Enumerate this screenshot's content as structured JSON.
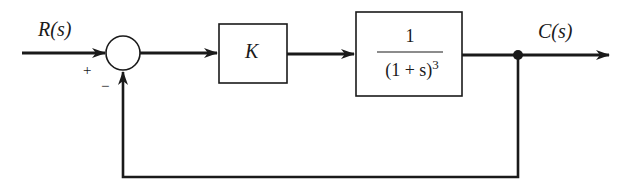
{
  "diagram": {
    "type": "block-diagram",
    "input_label": "R(s)",
    "output_label": "C(s)",
    "summing_junction": {
      "plus_sign": "+",
      "minus_sign": "−"
    },
    "blocks": [
      {
        "id": "gain",
        "label": "K"
      },
      {
        "id": "plant",
        "numerator": "1",
        "denominator": "(1 + s)",
        "exponent": "3"
      }
    ],
    "feedback": "unity negative feedback",
    "colors": {
      "line": "#1a1a1a",
      "background": "#ffffff"
    }
  }
}
